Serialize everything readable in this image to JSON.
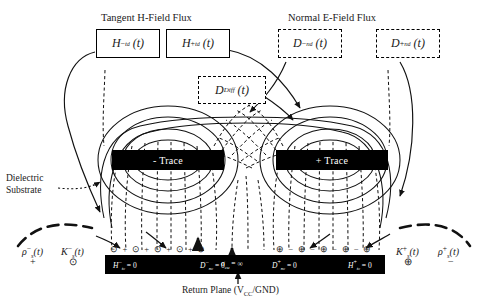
{
  "figure": {
    "title_left": "Tangent H-Field Flux",
    "title_right": "Normal E-Field Flux",
    "substrate_label_line1": "Dielectric",
    "substrate_label_line2": "Substrate",
    "return_plane_caption_prefix": "Return Plane (V",
    "return_plane_caption_sub": "CC",
    "return_plane_caption_suffix": "/GND)"
  },
  "flux_boxes": [
    {
      "id": "h-minus",
      "symbol": "H",
      "sup": "−",
      "sub": "t",
      "sub2": "d",
      "arg": "(t)",
      "style": "solid"
    },
    {
      "id": "h-plus",
      "symbol": "H",
      "sup": "+",
      "sub": "t",
      "sub2": "d",
      "arg": "(t)",
      "style": "solid"
    },
    {
      "id": "d-minus",
      "symbol": "D",
      "sup": "−",
      "sub": "n",
      "sub2": "d",
      "arg": "(t)",
      "style": "dashed"
    },
    {
      "id": "d-plus",
      "symbol": "D",
      "sup": "+",
      "sub": "n",
      "sub2": "d",
      "arg": "(t)",
      "style": "dashed"
    },
    {
      "id": "d-diff",
      "symbol": "D",
      "sup": "",
      "sub": "Diff",
      "sub2": "",
      "arg": "(t)",
      "style": "dashed"
    }
  ],
  "traces": [
    {
      "id": "neg-trace",
      "label": "- Trace"
    },
    {
      "id": "pos-trace",
      "label": "+ Trace"
    }
  ],
  "plane_labels": {
    "h_left": {
      "symbol": "H",
      "sup": "−",
      "sub": "t",
      "sub2": "c",
      "eq": "= 0"
    },
    "d_left": {
      "symbol": "D",
      "sup": "−",
      "sub": "n",
      "sub2": "c",
      "eq": "= 0"
    },
    "sigma": {
      "symbol": "σ",
      "sub": "cu",
      "eq": "= ∞"
    },
    "d_right": {
      "symbol": "D",
      "sup": "+",
      "sub": "n",
      "sub2": "c",
      "eq": "= 0"
    },
    "h_right": {
      "symbol": "H",
      "sup": "+",
      "sub": "t",
      "sub2": "c",
      "eq": "= 0"
    }
  },
  "charge_labels": {
    "left": {
      "rho": "ρ",
      "rho_sup": "−",
      "rho_sub": "s",
      "rho_arg": "(t)",
      "k": "K",
      "k_sup": "−",
      "k_sub": "s",
      "k_arg": "(t)",
      "rho_sign": "+",
      "k_sign": "⊙"
    },
    "right": {
      "k": "K",
      "k_sup": "+",
      "k_sub": "s",
      "k_arg": "(t)",
      "rho": "ρ",
      "rho_sup": "+",
      "rho_sub": "s",
      "rho_arg": "(t)",
      "k_sign": "⊕",
      "rho_sign": "−"
    }
  },
  "surface_charge_rows": {
    "left_row": "⊙ + ⊙ + ⊙ + ⊙ + ⊙",
    "right_row": "⊕ − ⊕ − ⊕ − ⊕ − ⊕"
  },
  "colors": {
    "ink": "#1a1a1a",
    "trace_fill": "#000000",
    "plane_fill": "#000000",
    "background": "#ffffff"
  }
}
